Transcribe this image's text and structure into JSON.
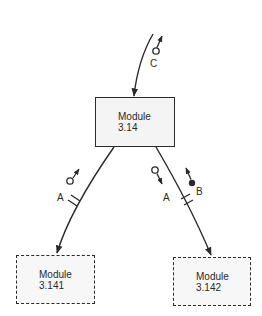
{
  "diagram": {
    "type": "structure-chart",
    "modules": [
      {
        "id": "m314",
        "line1": "Module",
        "line2": "3.14",
        "style": "solid"
      },
      {
        "id": "m3141",
        "line1": "Module",
        "line2": "3.141",
        "style": "dashed"
      },
      {
        "id": "m3142",
        "line1": "Module",
        "line2": "3.142",
        "style": "dashed"
      }
    ],
    "couples": [
      {
        "label": "C",
        "kind": "data",
        "symbol": "open-circle",
        "direction": "up",
        "on_edge": "caller-to-3.14"
      },
      {
        "label": "A",
        "kind": "data",
        "symbol": "open-circle",
        "direction": "up",
        "on_edge": "3.14-to-3.141"
      },
      {
        "label": "A",
        "kind": "data",
        "symbol": "open-circle",
        "direction": "down",
        "on_edge": "3.14-to-3.142"
      },
      {
        "label": "B",
        "kind": "control",
        "symbol": "filled-circle",
        "direction": "up",
        "on_edge": "3.14-to-3.142"
      }
    ],
    "edges": [
      {
        "from": "caller",
        "to": "3.14"
      },
      {
        "from": "3.14",
        "to": "3.141",
        "library_break": true
      },
      {
        "from": "3.14",
        "to": "3.142",
        "library_break": true
      }
    ],
    "colors": {
      "line": "#2a2a2a",
      "box_fill": "#f4f4f4"
    }
  }
}
